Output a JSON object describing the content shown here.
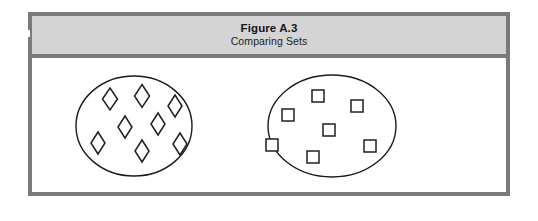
{
  "figure": {
    "title": "Figure A.3",
    "subtitle": "Comparing Sets",
    "frame_color": "#7a7a7a",
    "caption_band_color": "#d4d4d4",
    "background_color": "#ffffff",
    "ink_color": "#1a1a1a"
  },
  "diagram": {
    "type": "set-comparison",
    "sets": [
      {
        "name": "left-set",
        "element_shape": "diamond",
        "element_count": 8,
        "ellipse": {
          "cx": 102,
          "cy": 68,
          "rx": 58,
          "ry": 50
        },
        "elements": [
          {
            "cx": 78,
            "cy": 41,
            "w": 15,
            "h": 22
          },
          {
            "cx": 110,
            "cy": 38,
            "w": 15,
            "h": 23
          },
          {
            "cx": 143,
            "cy": 48,
            "w": 14,
            "h": 22
          },
          {
            "cx": 93,
            "cy": 69,
            "w": 14,
            "h": 22
          },
          {
            "cx": 126,
            "cy": 66,
            "w": 14,
            "h": 22
          },
          {
            "cx": 66,
            "cy": 85,
            "w": 14,
            "h": 22
          },
          {
            "cx": 110,
            "cy": 93,
            "w": 14,
            "h": 22
          },
          {
            "cx": 148,
            "cy": 86,
            "w": 14,
            "h": 22
          }
        ]
      },
      {
        "name": "right-set",
        "element_shape": "square",
        "element_count": 7,
        "ellipse": {
          "cx": 300,
          "cy": 68,
          "rx": 64,
          "ry": 51
        },
        "elements": [
          {
            "cx": 286,
            "cy": 38,
            "w": 12,
            "h": 12
          },
          {
            "cx": 325,
            "cy": 48,
            "w": 12,
            "h": 12
          },
          {
            "cx": 256,
            "cy": 57,
            "w": 12,
            "h": 12
          },
          {
            "cx": 297,
            "cy": 72,
            "w": 12,
            "h": 12
          },
          {
            "cx": 240,
            "cy": 87,
            "w": 12,
            "h": 12
          },
          {
            "cx": 338,
            "cy": 88,
            "w": 12,
            "h": 12
          },
          {
            "cx": 281,
            "cy": 99,
            "w": 12,
            "h": 12
          }
        ]
      }
    ]
  }
}
